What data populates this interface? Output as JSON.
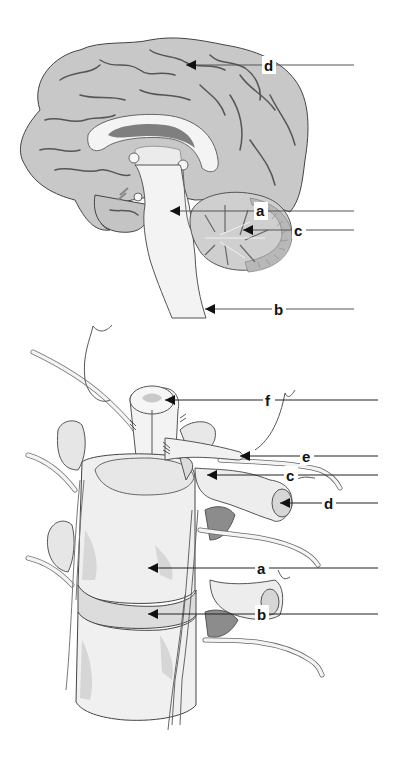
{
  "figures": [
    {
      "id": "brain",
      "description": "Midsagittal section of the brain",
      "labels": [
        {
          "letter": "d",
          "x": 268,
          "y": 65,
          "arrow_to_x": 186,
          "line_end_x": 354
        },
        {
          "letter": "a",
          "x": 260,
          "y": 211,
          "arrow_to_x": 170,
          "line_end_x": 354
        },
        {
          "letter": "c",
          "x": 298,
          "y": 230,
          "arrow_to_x": 243,
          "line_end_x": 354
        },
        {
          "letter": "b",
          "x": 278,
          "y": 309,
          "arrow_to_x": 205,
          "line_end_x": 354
        }
      ]
    },
    {
      "id": "spine",
      "description": "Vertebral column segment with spinal cord and nerves",
      "labels": [
        {
          "letter": "f",
          "x": 269,
          "y": 400,
          "arrow_to_x": 165,
          "line_end_x": 378
        },
        {
          "letter": "e",
          "x": 306,
          "y": 456,
          "arrow_to_x": 240,
          "line_end_x": 378
        },
        {
          "letter": "c",
          "x": 290,
          "y": 475,
          "arrow_to_x": 207,
          "line_end_x": 378
        },
        {
          "letter": "d",
          "x": 328,
          "y": 503,
          "arrow_to_x": 280,
          "line_end_x": 378
        },
        {
          "letter": "a",
          "x": 261,
          "y": 568,
          "arrow_to_x": 148,
          "line_end_x": 378
        },
        {
          "letter": "b",
          "x": 261,
          "y": 614,
          "arrow_to_x": 148,
          "line_end_x": 378
        }
      ]
    }
  ],
  "colors": {
    "cortex": "#c8c8c8",
    "cortex_dark": "#a9a9a9",
    "sulci": "#555555",
    "white_matter": "#f2f2f2",
    "ventricle": "#8a8a8a",
    "bone": "#efefef",
    "bone_shadow": "#cfcfcf",
    "background": "#ffffff"
  }
}
